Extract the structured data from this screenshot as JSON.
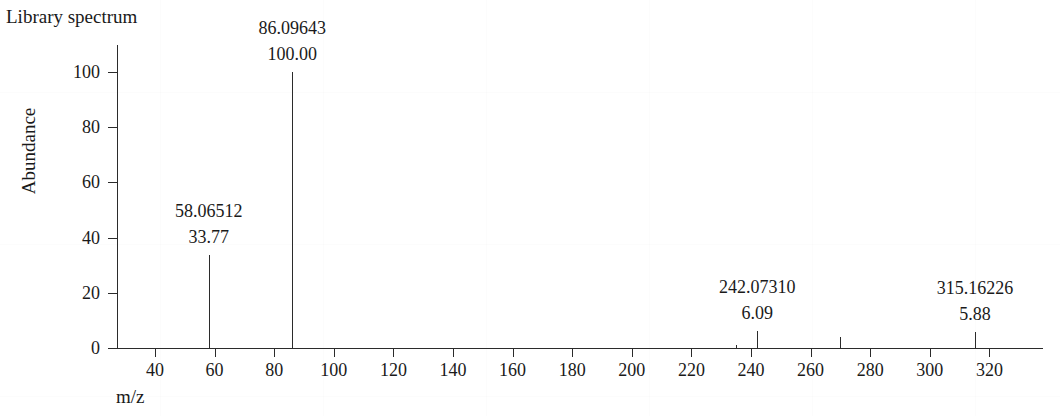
{
  "title": "Library spectrum",
  "axes": {
    "x_label": "m/z",
    "y_label": "Abundance"
  },
  "chart_data": {
    "type": "bar",
    "title": "Library spectrum",
    "xlabel": "m/z",
    "ylabel": "Abundance",
    "xlim": [
      30,
      330
    ],
    "ylim": [
      0,
      108
    ],
    "grid": false,
    "legend": null,
    "xticks": [
      40,
      60,
      80,
      100,
      120,
      140,
      160,
      180,
      200,
      220,
      240,
      260,
      280,
      300,
      320
    ],
    "yticks": [
      0,
      20,
      40,
      60,
      80,
      100
    ],
    "peaks": [
      {
        "mz": 58.06512,
        "intensity": 33.77,
        "mz_label": "58.06512",
        "intensity_label": "33.77",
        "labeled": true
      },
      {
        "mz": 86.09643,
        "intensity": 100.0,
        "mz_label": "86.09643",
        "intensity_label": "100.00",
        "labeled": true
      },
      {
        "mz": 235.0,
        "intensity": 1.0,
        "mz_label": "",
        "intensity_label": "",
        "labeled": false
      },
      {
        "mz": 242.0731,
        "intensity": 6.09,
        "mz_label": "242.07310",
        "intensity_label": "6.09",
        "labeled": true
      },
      {
        "mz": 270.0,
        "intensity": 4.1,
        "mz_label": "",
        "intensity_label": "",
        "labeled": false
      },
      {
        "mz": 315.16226,
        "intensity": 5.88,
        "mz_label": "315.16226",
        "intensity_label": "5.88",
        "labeled": true
      }
    ]
  },
  "colors": {
    "ink": "#2b2b2b",
    "background": "#ffffff"
  }
}
